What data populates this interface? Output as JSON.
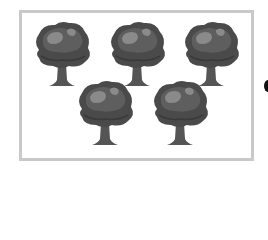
{
  "figure": {
    "tree_count": 5,
    "rows": [
      {
        "trees": 3
      },
      {
        "trees": 2
      }
    ],
    "colors": {
      "frame_border": "#c9c9c9",
      "canopy_dark": "#4a4a4a",
      "canopy_mid": "#5e5e5e",
      "canopy_light": "#8a8a8a",
      "trunk": "#555555"
    }
  },
  "trees": [
    {
      "x": 31,
      "y": 20
    },
    {
      "x": 106,
      "y": 20
    },
    {
      "x": 180,
      "y": 20
    },
    {
      "x": 74,
      "y": 79
    },
    {
      "x": 149,
      "y": 79
    }
  ]
}
